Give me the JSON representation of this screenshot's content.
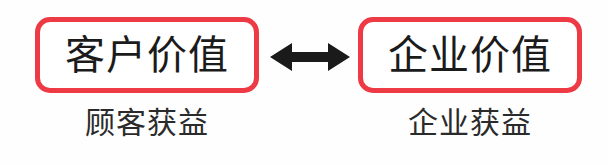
{
  "diagram": {
    "type": "two-way-relationship",
    "background_color": "#fefefe",
    "box_border_color": "#ee3a44",
    "box_text_color": "#1b1b1b",
    "caption_text_color": "#2b2b2b",
    "arrow_color": "#1a1a1a",
    "left": {
      "box_label": "客户价值",
      "caption": "顾客获益"
    },
    "right": {
      "box_label": "企业价值",
      "caption": "企业获益"
    },
    "connector": {
      "icon": "double-headed-arrow",
      "direction": "bidirectional"
    }
  }
}
